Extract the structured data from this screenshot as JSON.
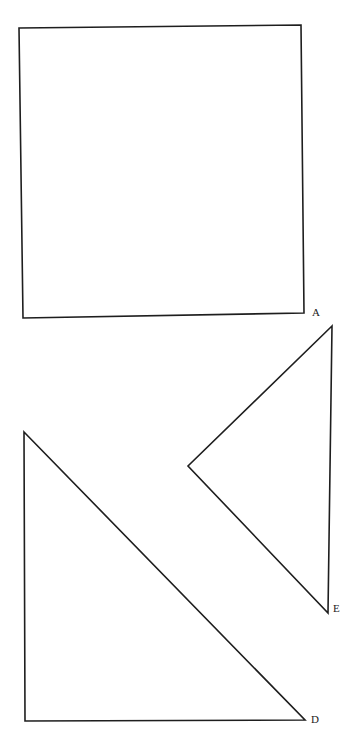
{
  "diagram": {
    "shapes": [
      {
        "id": "square",
        "type": "square",
        "label": "A",
        "points": [
          [
            19,
            28
          ],
          [
            301,
            25
          ],
          [
            304,
            313
          ],
          [
            23,
            318
          ]
        ],
        "label_pos": [
          312,
          316
        ]
      },
      {
        "id": "triangle-e",
        "type": "triangle",
        "label": "E",
        "points": [
          [
            332,
            326
          ],
          [
            188,
            466
          ],
          [
            328,
            613
          ]
        ],
        "label_pos": [
          333,
          612
        ]
      },
      {
        "id": "triangle-d",
        "type": "triangle",
        "label": "D",
        "points": [
          [
            24,
            432
          ],
          [
            305,
            720
          ],
          [
            25,
            721
          ]
        ],
        "label_pos": [
          312,
          722
        ]
      }
    ],
    "colors": {
      "stroke": "#1e1e1e",
      "background": "#ffffff"
    }
  },
  "labels": {
    "A": "A",
    "E": "E",
    "D": "D"
  }
}
